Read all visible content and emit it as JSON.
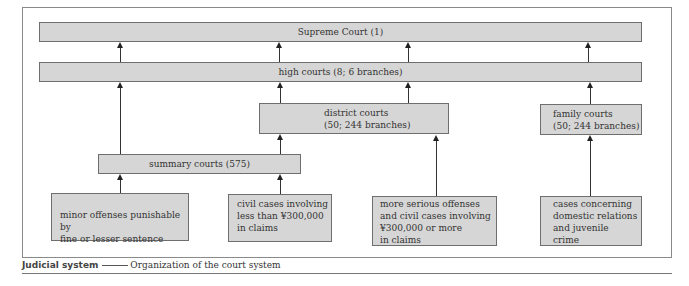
{
  "diagram": {
    "title": "Organization of the court system",
    "nodes": {
      "supreme": "Supreme Court (1)",
      "high": "high courts (8; 6 branches)",
      "district": "district courts\n(50; 244 branches)",
      "family": "family courts\n(50; 244 branches)",
      "summary": "summary courts (575)",
      "case_minor": "minor offenses punishable by\nfine or lesser sentence",
      "case_civil_small": "civil cases involving\nless than ¥300,000\nin claims",
      "case_serious": "more serious offenses\nand civil cases involving\n¥300,000 or more\nin claims",
      "case_family": "cases concerning\ndomestic relations\nand juvenile\ncrime"
    },
    "edges": [
      {
        "from": "high",
        "to": "supreme",
        "count": 4
      },
      {
        "from": "summary",
        "to": "high"
      },
      {
        "from": "district",
        "to": "high"
      },
      {
        "from": "case_serious",
        "to": "high"
      },
      {
        "from": "family",
        "to": "high"
      },
      {
        "from": "case_minor",
        "to": "summary"
      },
      {
        "from": "case_civil_small",
        "to": "summary"
      },
      {
        "from": "summary",
        "to": "district"
      },
      {
        "from": "case_serious",
        "to": "district"
      },
      {
        "from": "case_family",
        "to": "family"
      }
    ]
  },
  "caption": {
    "label": "Judicial system",
    "description": "Organization of the court system"
  },
  "colors": {
    "box_fill": "#d6d6d6",
    "box_border": "#6e6e6e",
    "line": "#333333"
  }
}
